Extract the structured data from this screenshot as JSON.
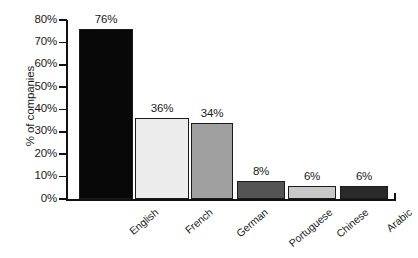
{
  "chart_data": {
    "type": "bar",
    "title": "",
    "xlabel": "",
    "ylabel": "% of companies",
    "categories": [
      "English",
      "French",
      "German",
      "Portuguese",
      "Chinese",
      "Arabic"
    ],
    "values": [
      76,
      36,
      34,
      8,
      6,
      6
    ],
    "value_labels": [
      "76%",
      "36%",
      "34%",
      "8%",
      "6%",
      "6%"
    ],
    "bar_colors": [
      "#080808",
      "#ececec",
      "#a0a0a0",
      "#545454",
      "#c8c8c8",
      "#2a2a2a"
    ],
    "bar_border_color": "#1b1b1b",
    "ylim": [
      0,
      80
    ],
    "ytick_values": [
      0,
      10,
      20,
      30,
      40,
      50,
      60,
      70,
      80
    ],
    "ytick_labels": [
      "0%",
      "10%",
      "20%",
      "30%",
      "40%",
      "50%",
      "60%",
      "70%",
      "80%"
    ],
    "grid": false,
    "legend": "none",
    "axis_color": "#111111"
  }
}
